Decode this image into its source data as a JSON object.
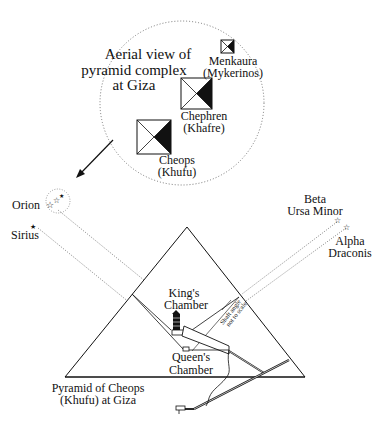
{
  "title": {
    "line1": "Aerial view of",
    "line2": "pyramid complex",
    "line3": "at Giza"
  },
  "pyramids_aerial": [
    {
      "name": "Menkaura",
      "alt": "(Mykerinos)"
    },
    {
      "name": "Chephren",
      "alt": "(Khafre)"
    },
    {
      "name": "Cheops",
      "alt": "(Khufu)"
    }
  ],
  "stars": {
    "orion": "Orion",
    "sirius": "Sirius",
    "beta_line1": "Beta",
    "beta_line2": "Ursa Minor",
    "alpha_line1": "Alpha",
    "alpha_line2": "Draconis"
  },
  "chambers": {
    "king_line1": "King's",
    "king_line2": "Chamber",
    "queen_line1": "Queen's",
    "queen_line2": "Chamber",
    "shaft_line1": "Shaft angle",
    "shaft_line2": "not to scale"
  },
  "caption": {
    "line1": "Pyramid of Cheops",
    "line2": "(Khufu) at Giza"
  }
}
